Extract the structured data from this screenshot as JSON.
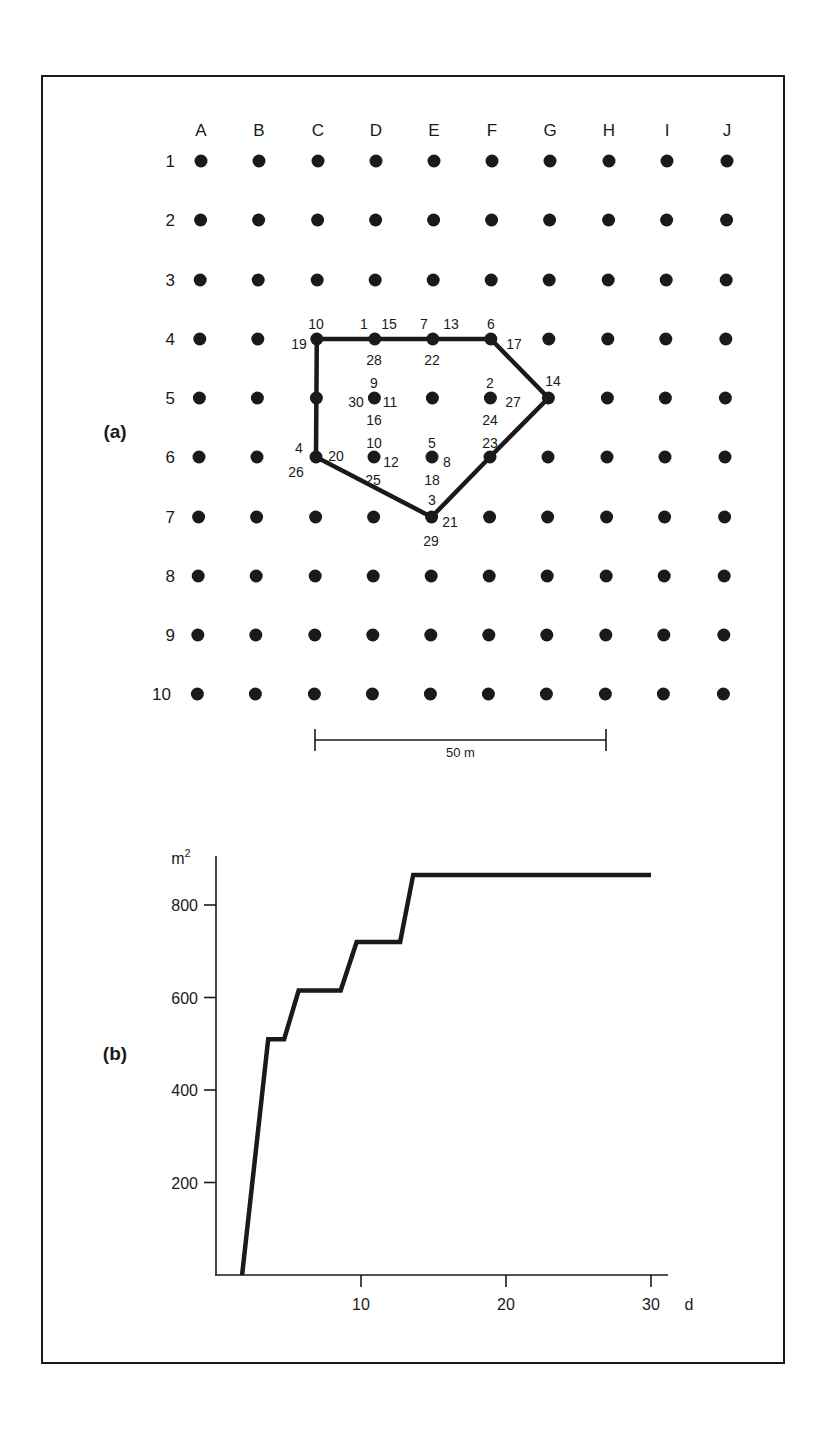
{
  "figure": {
    "frame": {
      "left": 42,
      "top": 76,
      "right": 784,
      "bottom": 1363
    },
    "ink_color": "#1a1a1a",
    "background": "#ffffff"
  },
  "panel_a": {
    "label": "(a)",
    "column_labels": [
      "A",
      "B",
      "C",
      "D",
      "E",
      "F",
      "G",
      "H",
      "I",
      "J"
    ],
    "row_labels": [
      "1",
      "2",
      "3",
      "4",
      "5",
      "6",
      "7",
      "8",
      "9",
      "10"
    ],
    "grid": {
      "col_x": [
        201,
        259,
        318,
        376,
        434,
        492,
        550,
        609,
        667,
        727
      ],
      "row_y": [
        161,
        220,
        280,
        339,
        398,
        457,
        517,
        576,
        635,
        694
      ],
      "dot_radius": 6.5
    },
    "polygon": {
      "description": "Home range / convex polygon enclosing fixes",
      "vertices": [
        "C4",
        "D4",
        "E4",
        "F4",
        "G5",
        "F6",
        "E7",
        "C6",
        "C5"
      ]
    },
    "point_labels": [
      {
        "text": "10",
        "x": 316,
        "y": 324
      },
      {
        "text": "19",
        "x": 299,
        "y": 344
      },
      {
        "text": "1",
        "x": 364,
        "y": 324
      },
      {
        "text": "15",
        "x": 389,
        "y": 324
      },
      {
        "text": "28",
        "x": 374,
        "y": 360
      },
      {
        "text": "7",
        "x": 424,
        "y": 324
      },
      {
        "text": "13",
        "x": 451,
        "y": 324
      },
      {
        "text": "22",
        "x": 432,
        "y": 360
      },
      {
        "text": "6",
        "x": 491,
        "y": 324
      },
      {
        "text": "17",
        "x": 514,
        "y": 344
      },
      {
        "text": "14",
        "x": 553,
        "y": 381
      },
      {
        "text": "9",
        "x": 374,
        "y": 383
      },
      {
        "text": "30",
        "x": 356,
        "y": 402
      },
      {
        "text": "11",
        "x": 390,
        "y": 402
      },
      {
        "text": "16",
        "x": 374,
        "y": 420
      },
      {
        "text": "2",
        "x": 490,
        "y": 383
      },
      {
        "text": "27",
        "x": 513,
        "y": 402
      },
      {
        "text": "24",
        "x": 490,
        "y": 420
      },
      {
        "text": "4",
        "x": 299,
        "y": 448
      },
      {
        "text": "26",
        "x": 296,
        "y": 472
      },
      {
        "text": "20",
        "x": 336,
        "y": 456
      },
      {
        "text": "10",
        "x": 374,
        "y": 443
      },
      {
        "text": "12",
        "x": 391,
        "y": 462
      },
      {
        "text": "25",
        "x": 373,
        "y": 480
      },
      {
        "text": "5",
        "x": 432,
        "y": 443
      },
      {
        "text": "8",
        "x": 447,
        "y": 462
      },
      {
        "text": "18",
        "x": 432,
        "y": 480
      },
      {
        "text": "23",
        "x": 490,
        "y": 443
      },
      {
        "text": "3",
        "x": 432,
        "y": 500
      },
      {
        "text": "21",
        "x": 450,
        "y": 522
      },
      {
        "text": "29",
        "x": 431,
        "y": 541
      }
    ],
    "scale_bar": {
      "label": "50 m",
      "from_col": "C",
      "to_col": "H",
      "y": 740
    },
    "label_pos": {
      "x": 115,
      "y": 438
    }
  },
  "chart_data": {
    "type": "line",
    "title": "",
    "panel_label": "(b)",
    "xlabel": "d",
    "ylabel": "m²",
    "ylabel_base": "m",
    "ylabel_sup": "2",
    "x_ticks": [
      10,
      20,
      30
    ],
    "y_ticks": [
      200,
      400,
      600,
      800
    ],
    "xlim": [
      0,
      31
    ],
    "ylim": [
      0,
      900
    ],
    "grid": false,
    "legend": null,
    "series": [
      {
        "name": "Cumulative home range area",
        "x": [
          1.8,
          3.6,
          4.7,
          5.7,
          8.6,
          9.7,
          12.7,
          13.6,
          30
        ],
        "y": [
          0,
          510,
          510,
          615,
          615,
          720,
          720,
          865,
          865
        ]
      }
    ]
  },
  "panel_b_layout": {
    "origin_x": 216,
    "origin_y": 1275,
    "px_per_x": 14.5,
    "px_per_y": 0.4625,
    "axis_top": 856,
    "axis_right": 668,
    "label_pos": {
      "x": 115,
      "y": 1060
    }
  }
}
